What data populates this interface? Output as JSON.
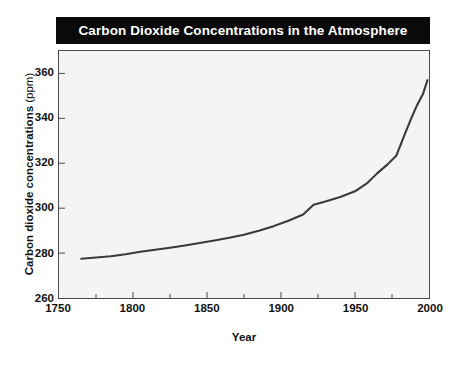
{
  "figure": {
    "title": "Carbon Dioxide Concentrations in the Atmosphere",
    "title_background": "#0a0a0a",
    "title_color": "#ffffff",
    "plot_background": "#f4f4f4",
    "frame_color": "#4a4a4a",
    "line_color": "#3a3a3a",
    "page_background": "#ffffff"
  },
  "chart_data": {
    "type": "line",
    "title": "Carbon Dioxide Concentrations in the Atmosphere",
    "xlabel": "Year",
    "ylabel": "Carbon dioxide concentrations (ppm)",
    "ylabel_main": "Carbon dioxide concentrations",
    "ylabel_unit": "(ppm)",
    "xlim": [
      1750,
      2000
    ],
    "ylim": [
      260,
      370
    ],
    "xticks": [
      1750,
      1800,
      1850,
      1900,
      1950,
      2000
    ],
    "xtick_labels": [
      "1750",
      "1800",
      "1850",
      "1900",
      "1950",
      "2000"
    ],
    "xminor_ticks": [
      1775,
      1825,
      1875,
      1925,
      1975
    ],
    "yticks": [
      260,
      280,
      300,
      320,
      340,
      360
    ],
    "ytick_labels": [
      "260",
      "280",
      "300",
      "320",
      "340",
      "360"
    ],
    "grid": false,
    "legend": "none",
    "series": [
      {
        "name": "Atmospheric CO2 concentration",
        "units": "ppm",
        "x": [
          1765,
          1775,
          1785,
          1795,
          1805,
          1815,
          1825,
          1835,
          1845,
          1855,
          1865,
          1875,
          1885,
          1895,
          1905,
          1915,
          1922,
          1930,
          1940,
          1950,
          1958,
          1965,
          1972,
          1978,
          1984,
          1988,
          1992,
          1996,
          1999
        ],
        "values": [
          277.5,
          278.0,
          278.6,
          279.5,
          280.6,
          281.5,
          282.4,
          283.4,
          284.5,
          285.6,
          286.8,
          288.2,
          290.0,
          292.0,
          294.4,
          297.2,
          301.5,
          303.0,
          305.0,
          307.5,
          311.0,
          315.5,
          319.5,
          323.5,
          333.5,
          340.0,
          346.0,
          351.0,
          357.0
        ]
      }
    ],
    "annotations": []
  },
  "axis_geometry": {
    "plot_left": 58,
    "plot_top": 50,
    "plot_width": 372,
    "plot_height": 249
  }
}
